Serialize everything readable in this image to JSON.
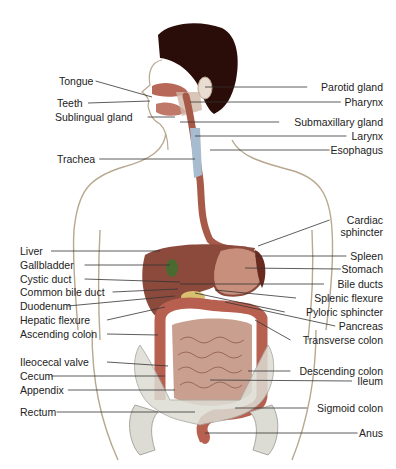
{
  "diagram": {
    "colors": {
      "skin_outline": "#b8a890",
      "hair": "#2a0c08",
      "organ_dark": "#8c4a3c",
      "organ_mid": "#a85a48",
      "organ_light": "#c8907c",
      "intestine": "#c9a090",
      "gallbladder": "#4a6a30",
      "pancreas": "#d8c070",
      "trachea": "#a8bcd0",
      "bone": "#dcdcd4",
      "leader_line": "#333333"
    },
    "left_labels": [
      {
        "id": "tongue",
        "text": "Tongue",
        "x": 59,
        "y": 75,
        "tx": 152,
        "ty": 97
      },
      {
        "id": "teeth",
        "text": "Teeth",
        "x": 57,
        "y": 97,
        "tx": 150,
        "ty": 101
      },
      {
        "id": "sublingual-gland",
        "text": "Sublingual gland",
        "x": 55,
        "y": 111,
        "tx": 175,
        "ty": 117
      },
      {
        "id": "trachea",
        "text": "Trachea",
        "x": 57,
        "y": 153,
        "tx": 195,
        "ty": 159
      },
      {
        "id": "liver",
        "text": "Liver",
        "x": 20,
        "y": 245,
        "tx": 160,
        "ty": 251
      },
      {
        "id": "gallbladder",
        "text": "Gallbladder",
        "x": 20,
        "y": 259,
        "tx": 170,
        "ty": 265
      },
      {
        "id": "cystic-duct",
        "text": "Cystic duct",
        "x": 20,
        "y": 273,
        "tx": 180,
        "ty": 282
      },
      {
        "id": "common-bile-duct",
        "text": "Common bile duct",
        "x": 20,
        "y": 286,
        "tx": 178,
        "ty": 289
      },
      {
        "id": "duodenum",
        "text": "Duodenum",
        "x": 20,
        "y": 300,
        "tx": 175,
        "ty": 296
      },
      {
        "id": "hepatic-flexure",
        "text": "Hepatic flexure",
        "x": 20,
        "y": 314,
        "tx": 165,
        "ty": 307
      },
      {
        "id": "ascending-colon",
        "text": "Ascending colon",
        "x": 20,
        "y": 328,
        "tx": 158,
        "ty": 335
      },
      {
        "id": "ileocecal-valve",
        "text": "Ileocecal valve",
        "x": 20,
        "y": 356,
        "tx": 168,
        "ty": 366
      },
      {
        "id": "cecum",
        "text": "Cecum",
        "x": 20,
        "y": 370,
        "tx": 165,
        "ty": 376
      },
      {
        "id": "appendix",
        "text": "Appendix",
        "x": 20,
        "y": 384,
        "tx": 175,
        "ty": 390
      },
      {
        "id": "rectum",
        "text": "Rectum",
        "x": 20,
        "y": 406,
        "tx": 195,
        "ty": 412
      }
    ],
    "right_labels": [
      {
        "id": "parotid-gland",
        "text": "Parotid gland",
        "x": 383,
        "y": 81,
        "tx": 205,
        "ty": 87
      },
      {
        "id": "pharynx",
        "text": "Pharynx",
        "x": 383,
        "y": 96,
        "tx": 190,
        "ty": 102
      },
      {
        "id": "submaxillary-gland",
        "text": "Submaxillary gland",
        "x": 383,
        "y": 116,
        "tx": 180,
        "ty": 122
      },
      {
        "id": "larynx",
        "text": "Larynx",
        "x": 383,
        "y": 130,
        "tx": 195,
        "ty": 136
      },
      {
        "id": "esophagus",
        "text": "Esophagus",
        "x": 383,
        "y": 144,
        "tx": 210,
        "ty": 150
      },
      {
        "id": "cardiac-sphincter",
        "text": "Cardiac\nsphincter",
        "x": 383,
        "y": 214,
        "tx": 258,
        "ty": 246
      },
      {
        "id": "spleen",
        "text": "Spleen",
        "x": 383,
        "y": 250,
        "tx": 255,
        "ty": 256
      },
      {
        "id": "stomach",
        "text": "Stomach",
        "x": 383,
        "y": 263,
        "tx": 245,
        "ty": 268
      },
      {
        "id": "bile-ducts",
        "text": "Bile ducts",
        "x": 383,
        "y": 278,
        "tx": 180,
        "ty": 284
      },
      {
        "id": "splenic-flexure",
        "text": "Splenic flexure",
        "x": 383,
        "y": 292,
        "tx": 215,
        "ty": 290
      },
      {
        "id": "pyloric-sphincter",
        "text": "Pyloric sphincter",
        "x": 383,
        "y": 306,
        "tx": 195,
        "ty": 293
      },
      {
        "id": "pancreas",
        "text": "Pancreas",
        "x": 383,
        "y": 320,
        "tx": 225,
        "ty": 302
      },
      {
        "id": "transverse-colon",
        "text": "Transverse colon",
        "x": 383,
        "y": 334,
        "tx": 255,
        "ty": 320
      },
      {
        "id": "descending-colon",
        "text": "Descending colon",
        "x": 383,
        "y": 365,
        "tx": 248,
        "ty": 371
      },
      {
        "id": "ileum",
        "text": "Ileum",
        "x": 383,
        "y": 375,
        "tx": 210,
        "ty": 380
      },
      {
        "id": "sigmoid-colon",
        "text": "Sigmoid colon",
        "x": 383,
        "y": 402,
        "tx": 235,
        "ty": 408
      },
      {
        "id": "anus",
        "text": "Anus",
        "x": 383,
        "y": 427,
        "tx": 205,
        "ty": 433
      }
    ]
  }
}
